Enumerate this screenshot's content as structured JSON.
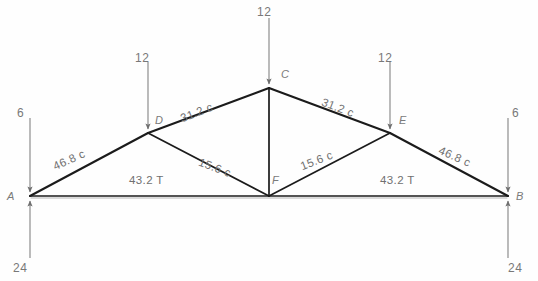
{
  "diagram": {
    "stroke_color": "#1b1b1b",
    "arrow_color": "#8a8a8a",
    "text_color": "#707070"
  },
  "nodes": [
    {
      "id": "A",
      "label": "A",
      "x": 30,
      "y": 196
    },
    {
      "id": "B",
      "label": "B",
      "x": 508,
      "y": 196
    },
    {
      "id": "C",
      "label": "C",
      "x": 269,
      "y": 88
    },
    {
      "id": "D",
      "label": "D",
      "x": 148,
      "y": 133
    },
    {
      "id": "E",
      "label": "E",
      "x": 390,
      "y": 133
    },
    {
      "id": "F",
      "label": "F",
      "x": 269,
      "y": 196
    }
  ],
  "members": [
    {
      "from": "A",
      "to": "D",
      "force": "46.8 c"
    },
    {
      "from": "D",
      "to": "C",
      "force": "31.2 c"
    },
    {
      "from": "C",
      "to": "E",
      "force": "31.2 c"
    },
    {
      "from": "E",
      "to": "B",
      "force": "46.8 c"
    },
    {
      "from": "D",
      "to": "F",
      "force": "15.6 c"
    },
    {
      "from": "F",
      "to": "E",
      "force": "15.6 c"
    },
    {
      "from": "A",
      "to": "F",
      "force": "43.2 T"
    },
    {
      "from": "F",
      "to": "B",
      "force": "43.2 T"
    },
    {
      "from": "C",
      "to": "F",
      "force": ""
    }
  ],
  "loads": [
    {
      "at": "A",
      "value": "6",
      "direction": "down"
    },
    {
      "at": "D",
      "value": "12",
      "direction": "down"
    },
    {
      "at": "C",
      "value": "12",
      "direction": "down"
    },
    {
      "at": "E",
      "value": "12",
      "direction": "down"
    },
    {
      "at": "B",
      "value": "6",
      "direction": "down"
    }
  ],
  "reactions": [
    {
      "at": "A",
      "value": "24",
      "direction": "up"
    },
    {
      "at": "B",
      "value": "24",
      "direction": "up"
    }
  ]
}
